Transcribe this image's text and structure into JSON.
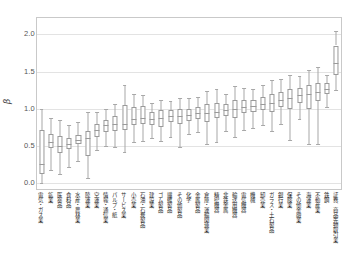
{
  "chart_data": {
    "type": "box",
    "title": "",
    "xlabel": "",
    "ylabel": "β",
    "ylim": [
      -0.08,
      2.22
    ],
    "yticks": [
      0.0,
      0.5,
      1.0,
      1.5,
      2.0
    ],
    "ytick_labels": [
      "0.0",
      "0.5",
      "1.0",
      "1.5",
      "2.0"
    ],
    "grid": true,
    "legend": "none",
    "categories": [
      "電気・ガス業",
      "鉱業",
      "医薬品",
      "食料品",
      "水産・農林業",
      "陸運業",
      "空運業",
      "情報・通信業",
      "パルプ・紙",
      "サービス業",
      "小売業",
      "石油・石炭製品",
      "建設業",
      "ゴム製品",
      "繊維製品",
      "その他製品",
      "化学",
      "金属製品",
      "倉庫・運輸関連業",
      "精密機器",
      "非鉄金属",
      "輸送用機器",
      "電気機器",
      "機械",
      "卸売業",
      "ガラス・土石製品",
      "銀行業",
      "保険業",
      "その他金融業",
      "海運業",
      "不動産業",
      "鉄鋼",
      "証券、商品先物取引業"
    ],
    "boxes": [
      {
        "name": "電気・ガス業",
        "whisker_low": 0.0,
        "q1": 0.12,
        "median": 0.25,
        "q3": 0.72,
        "whisker_high": 1.0
      },
      {
        "name": "鉱業",
        "whisker_low": 0.17,
        "q1": 0.47,
        "median": 0.55,
        "q3": 0.66,
        "whisker_high": 0.87
      },
      {
        "name": "医薬品",
        "whisker_low": 0.12,
        "q1": 0.41,
        "median": 0.5,
        "q3": 0.63,
        "whisker_high": 0.85
      },
      {
        "name": "食料品",
        "whisker_low": 0.22,
        "q1": 0.46,
        "median": 0.52,
        "q3": 0.61,
        "whisker_high": 0.78
      },
      {
        "name": "水産・農林業",
        "whisker_low": 0.3,
        "q1": 0.52,
        "median": 0.58,
        "q3": 0.65,
        "whisker_high": 0.82
      },
      {
        "name": "陸運業",
        "whisker_low": 0.07,
        "q1": 0.37,
        "median": 0.6,
        "q3": 0.7,
        "whisker_high": 0.95
      },
      {
        "name": "空運業",
        "whisker_low": 0.44,
        "q1": 0.62,
        "median": 0.72,
        "q3": 0.8,
        "whisker_high": 0.96
      },
      {
        "name": "情報・通信業",
        "whisker_low": 0.5,
        "q1": 0.68,
        "median": 0.78,
        "q3": 0.85,
        "whisker_high": 1.0
      },
      {
        "name": "パルプ・紙",
        "whisker_low": 0.48,
        "q1": 0.7,
        "median": 0.8,
        "q3": 0.9,
        "whisker_high": 1.06
      },
      {
        "name": "サービス業",
        "whisker_low": 0.42,
        "q1": 0.72,
        "median": 0.8,
        "q3": 1.05,
        "whisker_high": 1.32
      },
      {
        "name": "小売業",
        "whisker_low": 0.55,
        "q1": 0.78,
        "median": 0.86,
        "q3": 1.02,
        "whisker_high": 1.2
      },
      {
        "name": "石油・石炭製品",
        "whisker_low": 0.56,
        "q1": 0.8,
        "median": 0.88,
        "q3": 1.04,
        "whisker_high": 1.18
      },
      {
        "name": "建設業",
        "whisker_low": 0.6,
        "q1": 0.78,
        "median": 0.86,
        "q3": 0.96,
        "whisker_high": 1.08
      },
      {
        "name": "ゴム製品",
        "whisker_low": 0.57,
        "q1": 0.76,
        "median": 0.88,
        "q3": 0.98,
        "whisker_high": 1.12
      },
      {
        "name": "繊維製品",
        "whisker_low": 0.62,
        "q1": 0.82,
        "median": 0.9,
        "q3": 0.98,
        "whisker_high": 1.1
      },
      {
        "name": "その他製品",
        "whisker_low": 0.48,
        "q1": 0.8,
        "median": 0.9,
        "q3": 1.0,
        "whisker_high": 1.15
      },
      {
        "name": "化学",
        "whisker_low": 0.66,
        "q1": 0.84,
        "median": 0.92,
        "q3": 1.0,
        "whisker_high": 1.14
      },
      {
        "name": "金属製品",
        "whisker_low": 0.68,
        "q1": 0.86,
        "median": 0.94,
        "q3": 1.02,
        "whisker_high": 1.16
      },
      {
        "name": "倉庫・運輸関連業",
        "whisker_low": 0.52,
        "q1": 0.82,
        "median": 0.94,
        "q3": 1.06,
        "whisker_high": 1.24
      },
      {
        "name": "精密機器",
        "whisker_low": 0.55,
        "q1": 0.88,
        "median": 0.96,
        "q3": 1.08,
        "whisker_high": 1.26
      },
      {
        "name": "非鉄金属",
        "whisker_low": 0.7,
        "q1": 0.9,
        "median": 0.98,
        "q3": 1.06,
        "whisker_high": 1.2
      },
      {
        "name": "輸送用機器",
        "whisker_low": 0.62,
        "q1": 0.88,
        "median": 1.0,
        "q3": 1.12,
        "whisker_high": 1.3
      },
      {
        "name": "電気機器",
        "whisker_low": 0.72,
        "q1": 0.94,
        "median": 1.02,
        "q3": 1.12,
        "whisker_high": 1.28
      },
      {
        "name": "機械",
        "whisker_low": 0.74,
        "q1": 0.96,
        "median": 1.04,
        "q3": 1.12,
        "whisker_high": 1.26
      },
      {
        "name": "卸売業",
        "whisker_low": 0.78,
        "q1": 0.98,
        "median": 1.06,
        "q3": 1.16,
        "whisker_high": 1.32
      },
      {
        "name": "ガラス・土石製品",
        "whisker_low": 0.7,
        "q1": 0.96,
        "median": 1.08,
        "q3": 1.2,
        "whisker_high": 1.38
      },
      {
        "name": "銀行業",
        "whisker_low": 0.8,
        "q1": 1.02,
        "median": 1.12,
        "q3": 1.22,
        "whisker_high": 1.4
      },
      {
        "name": "保険業",
        "whisker_low": 0.58,
        "q1": 1.0,
        "median": 1.14,
        "q3": 1.26,
        "whisker_high": 1.46
      },
      {
        "name": "その他金融業",
        "whisker_low": 0.86,
        "q1": 1.08,
        "median": 1.18,
        "q3": 1.28,
        "whisker_high": 1.44
      },
      {
        "name": "海運業",
        "whisker_low": 0.52,
        "q1": 1.0,
        "median": 1.2,
        "q3": 1.32,
        "whisker_high": 1.52
      },
      {
        "name": "不動産業",
        "whisker_low": 0.52,
        "q1": 1.1,
        "median": 1.22,
        "q3": 1.34,
        "whisker_high": 1.56
      },
      {
        "name": "鉄鋼",
        "whisker_low": 1.02,
        "q1": 1.2,
        "median": 1.26,
        "q3": 1.34,
        "whisker_high": 1.46
      },
      {
        "name": "証券、商品先物取引業",
        "whisker_low": 1.25,
        "q1": 1.45,
        "median": 1.62,
        "q3": 1.85,
        "whisker_high": 2.05
      }
    ]
  },
  "style": {
    "line_color": "#9a9a9a",
    "grid_color": "#e3e3e3",
    "frame_color": "#c9c9c9",
    "text_color": "#2e2e2e",
    "background": "#ffffff"
  }
}
